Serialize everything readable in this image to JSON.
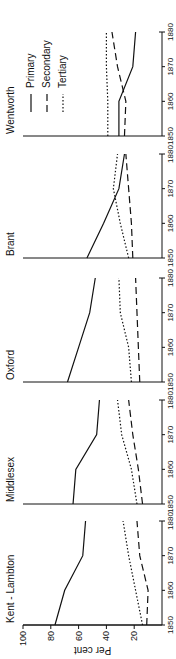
{
  "chart_data": {
    "type": "line",
    "layout": "small-multiples",
    "ylabel": "Per cent",
    "ylim": [
      0,
      100
    ],
    "yticks": [
      20,
      40,
      60,
      80,
      100
    ],
    "xticks": [
      1850,
      1860,
      1870,
      1880
    ],
    "x": [
      1850,
      1860,
      1870,
      1880
    ],
    "grid": false,
    "legend": {
      "position": "inside last panel (Wentworth)",
      "entries": [
        {
          "name": "Primary",
          "style": "solid"
        },
        {
          "name": "Secondary",
          "style": "dashed"
        },
        {
          "name": "Tertiary",
          "style": "dotted"
        }
      ]
    },
    "panels": [
      {
        "title": "Kent - Lambton",
        "series": [
          {
            "name": "Primary",
            "values": [
              77,
              70,
              57,
              55
            ]
          },
          {
            "name": "Secondary",
            "values": [
              11,
              10,
              16,
              18
            ]
          },
          {
            "name": "Tertiary",
            "values": [
              14,
              19,
              24,
              28
            ]
          }
        ]
      },
      {
        "title": "Middlesex",
        "series": [
          {
            "name": "Primary",
            "values": [
              64,
              62,
              47,
              45
            ]
          },
          {
            "name": "Secondary",
            "values": [
              14,
              17,
              21,
              24
            ]
          },
          {
            "name": "Tertiary",
            "values": [
              18,
              22,
              29,
              32
            ]
          }
        ]
      },
      {
        "title": "Oxford",
        "series": [
          {
            "name": "Primary",
            "values": [
              68,
              60,
              52,
              48
            ]
          },
          {
            "name": "Secondary",
            "values": [
              16,
              17,
              18,
              19
            ]
          },
          {
            "name": "Tertiary",
            "values": [
              22,
              24,
              30,
              31
            ]
          }
        ]
      },
      {
        "title": "Brant",
        "series": [
          {
            "name": "Primary",
            "values": [
              54,
              42,
              31,
              27
            ]
          },
          {
            "name": "Secondary",
            "values": [
              21,
              22,
              24,
              26
            ]
          },
          {
            "name": "Tertiary",
            "values": [
              24,
              30,
              35,
              32
            ]
          }
        ]
      },
      {
        "title": "Wentworth",
        "series": [
          {
            "name": "Primary",
            "values": [
              31,
              31,
              21,
              19
            ]
          },
          {
            "name": "Secondary",
            "values": [
              27,
              26,
              32,
              36
            ]
          },
          {
            "name": "Tertiary",
            "values": [
              39,
              39,
              40,
              40
            ]
          }
        ]
      }
    ]
  }
}
